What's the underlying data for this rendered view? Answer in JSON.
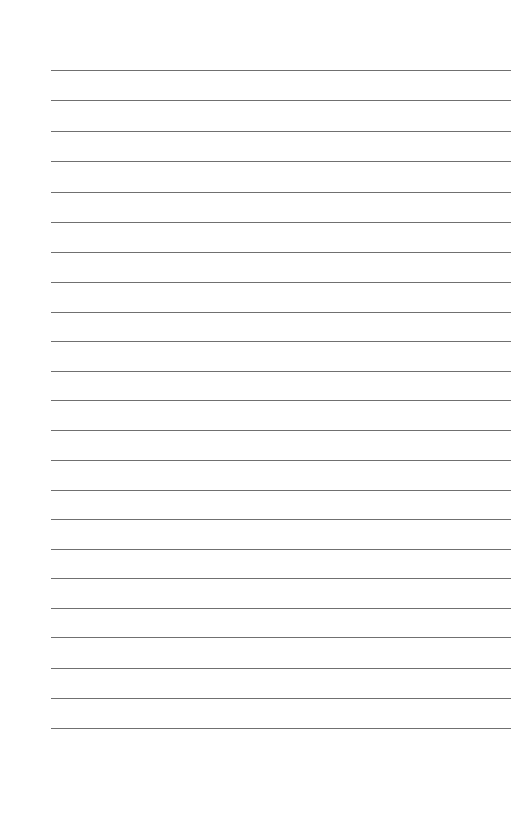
{
  "page": {
    "type": "lined-paper",
    "background_color": "#ffffff",
    "line_color": "#707070",
    "line_count": 23,
    "line_left": 51,
    "line_right": 511,
    "line_positions_y": [
      70,
      100,
      131,
      161,
      192,
      222,
      252,
      282,
      312,
      341,
      371,
      400,
      430,
      460,
      490,
      519,
      549,
      578,
      608,
      637,
      668,
      698,
      728
    ]
  }
}
